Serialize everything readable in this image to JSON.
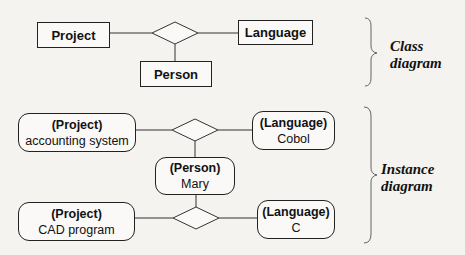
{
  "class_diagram": {
    "label_line1": "Class",
    "label_line2": "diagram",
    "entities": {
      "project": "Project",
      "language": "Language",
      "person": "Person"
    },
    "relationship": "ternary association (diamond)"
  },
  "instance_diagram": {
    "label_line1": "Instance",
    "label_line2": "diagram",
    "links": [
      {
        "project": {
          "class": "(Project)",
          "name": "accounting system"
        },
        "language": {
          "class": "(Language)",
          "name": "Cobol"
        },
        "person": {
          "class": "(Person)",
          "name": "Mary"
        }
      },
      {
        "project": {
          "class": "(Project)",
          "name": "CAD program"
        },
        "language": {
          "class": "(Language)",
          "name": "C"
        },
        "person": {
          "class": "(Person)",
          "name": "Mary"
        }
      }
    ],
    "person": {
      "class": "(Person)",
      "name": "Mary"
    }
  },
  "colors": {
    "background": "#f4f3f0",
    "stroke": "#222222",
    "text": "#111111"
  }
}
